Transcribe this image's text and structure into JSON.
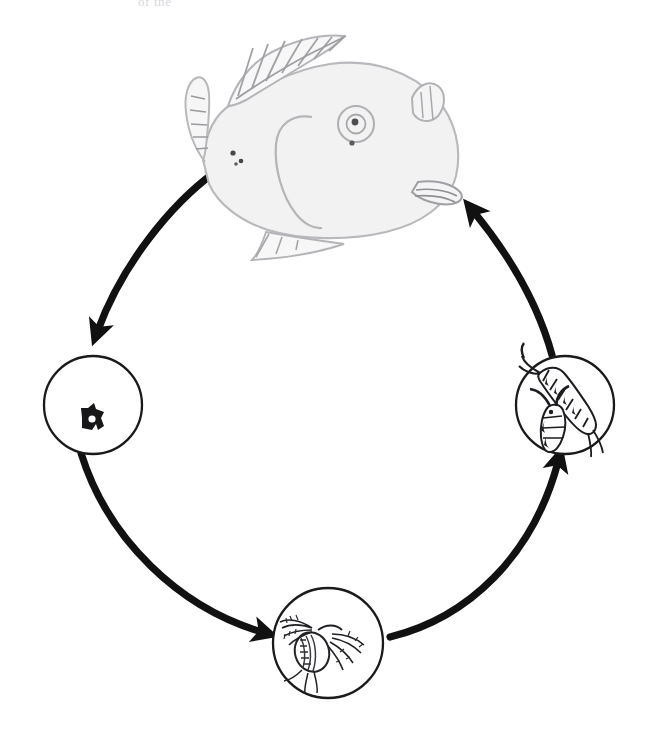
{
  "document": {
    "title": "Fish parasite / prey life cycle",
    "background_color": "#ffffff",
    "width": 663,
    "height": 752,
    "cropped_header_text": "of the"
  },
  "diagram": {
    "type": "cycle",
    "orientation": "clockwise",
    "stroke_color": "#1a1a1a",
    "node_fill": "#ffffff",
    "node_stroke_width": 2.2,
    "arrow_color": "#111111",
    "arrow_width": 7,
    "nodes": [
      {
        "id": "host-fish",
        "label": "fish",
        "stage_name": "Adult fish host",
        "shape": "illustration",
        "icon": "fish-icon",
        "cx": 318,
        "cy": 135,
        "body_fill": "#f2f2f2",
        "outline_color": "#b8b8bc"
      },
      {
        "id": "egg",
        "label": "egg",
        "stage_name": "Egg",
        "shape": "circle",
        "icon": "egg-icon",
        "cx": 93,
        "cy": 405,
        "r": 49
      },
      {
        "id": "nauplius",
        "label": "nauplius larva",
        "stage_name": "Nauplius larva",
        "shape": "circle",
        "icon": "nauplius-icon",
        "cx": 328,
        "cy": 643,
        "r": 55
      },
      {
        "id": "copepodite",
        "label": "copepodites",
        "stage_name": "Copepodite / adult copepods",
        "shape": "circle",
        "icon": "copepod-icon",
        "cx": 565,
        "cy": 405,
        "r": 49
      }
    ],
    "arrows": [
      {
        "id": "arrow-fish-to-egg",
        "from": "host-fish",
        "to": "egg",
        "direction": "down-left"
      },
      {
        "id": "arrow-egg-to-nauplius",
        "from": "egg",
        "to": "nauplius",
        "direction": "down-right"
      },
      {
        "id": "arrow-nauplius-to-copepodite",
        "from": "nauplius",
        "to": "copepodite",
        "direction": "up-right"
      },
      {
        "id": "arrow-copepodite-to-fish",
        "from": "copepodite",
        "to": "host-fish",
        "direction": "up-left"
      }
    ]
  }
}
